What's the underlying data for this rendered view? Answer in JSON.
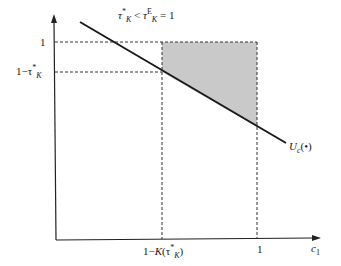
{
  "diagram": {
    "title": {
      "tau": "τ",
      "star": "*",
      "sub_K": "K",
      "lt": " < ",
      "tauE": "τ",
      "sup_E": "E",
      "sub_K2": "K",
      "eq": " = 1"
    },
    "y_axis": {
      "tick_one": "1",
      "tick_lower_prefix": "1−τ",
      "tick_lower_star": "*",
      "tick_lower_sub": "K"
    },
    "x_axis": {
      "label_main": "c",
      "label_sub": "1",
      "tick_one": "1",
      "tick_left_prefix": "1−",
      "tick_left_K": "K",
      "tick_left_open": "(τ",
      "tick_left_star": "*",
      "tick_left_sub": "K",
      "tick_left_close": ")"
    },
    "curve": {
      "label_main": "U",
      "label_sub": "c",
      "label_arg": "(•)"
    },
    "colors": {
      "line": "#1a1a1a",
      "shade": "#c8c8c8",
      "dash": "#333333"
    }
  }
}
